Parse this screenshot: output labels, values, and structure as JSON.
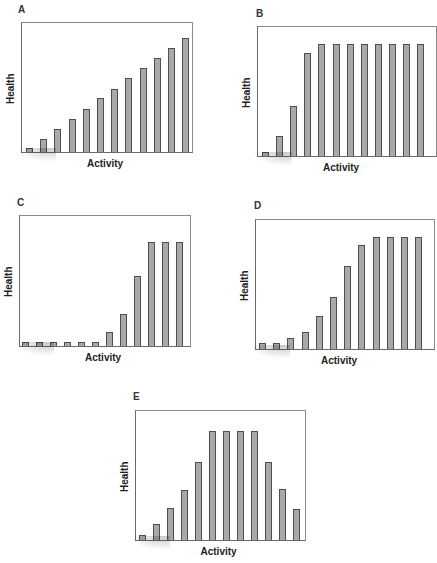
{
  "chart_data": [
    {
      "panel": "A",
      "type": "bar",
      "xlabel": "Activity",
      "ylabel": "Health",
      "categories": [
        1,
        2,
        3,
        4,
        5,
        6,
        7,
        8,
        9,
        10,
        11,
        12
      ],
      "values": [
        3,
        11,
        20,
        28,
        37,
        46,
        54,
        63,
        72,
        80,
        89,
        97
      ],
      "ylim": [
        0,
        110
      ],
      "grid": false,
      "axis_ticks": false
    },
    {
      "panel": "B",
      "type": "bar",
      "xlabel": "Activity",
      "ylabel": "Health",
      "categories": [
        1,
        2,
        3,
        4,
        5,
        6,
        7,
        8,
        9,
        10,
        11,
        12
      ],
      "values": [
        4,
        18,
        45,
        92,
        100,
        100,
        100,
        100,
        100,
        100,
        100,
        100
      ],
      "ylim": [
        0,
        115
      ],
      "grid": false,
      "axis_ticks": false
    },
    {
      "panel": "C",
      "type": "bar",
      "xlabel": "Activity",
      "ylabel": "Health",
      "categories": [
        1,
        2,
        3,
        4,
        5,
        6,
        7,
        8,
        9,
        10,
        11,
        12
      ],
      "values": [
        4,
        4,
        4,
        4,
        4,
        4,
        13,
        31,
        67,
        100,
        100,
        100
      ],
      "ylim": [
        0,
        125
      ],
      "grid": false,
      "axis_ticks": false
    },
    {
      "panel": "D",
      "type": "bar",
      "xlabel": "Activity",
      "ylabel": "Health",
      "categories": [
        1,
        2,
        3,
        4,
        5,
        6,
        7,
        8,
        9,
        10,
        11,
        12
      ],
      "values": [
        5,
        5,
        10,
        15,
        29,
        46,
        74,
        93,
        100,
        100,
        100,
        100
      ],
      "ylim": [
        0,
        115
      ],
      "grid": false,
      "axis_ticks": false
    },
    {
      "panel": "E",
      "type": "bar",
      "xlabel": "Activity",
      "ylabel": "Health",
      "categories": [
        1,
        2,
        3,
        4,
        5,
        6,
        7,
        8,
        9,
        10,
        11,
        12
      ],
      "values": [
        5,
        15,
        29,
        46,
        71,
        100,
        100,
        100,
        100,
        71,
        47,
        28
      ],
      "ylim": [
        0,
        118
      ],
      "grid": false,
      "axis_ticks": false
    }
  ],
  "colors": {
    "bar_fill": "#a9a9a9",
    "bar_edge": "#4e4e4e",
    "frame": "#6a6a6a"
  },
  "layout": [
    {
      "label_x": 18,
      "label_y": 4,
      "frame": [
        21,
        22,
        172,
        131
      ],
      "bars_start": 4,
      "pitch": 14.2
    },
    {
      "label_x": 256,
      "label_y": 8,
      "frame": [
        257,
        26,
        180,
        131
      ],
      "bars_start": 4,
      "pitch": 14.1
    },
    {
      "label_x": 17,
      "label_y": 197,
      "frame": [
        19,
        215,
        172,
        132
      ],
      "bars_start": 2,
      "pitch": 14.0
    },
    {
      "label_x": 254,
      "label_y": 200,
      "frame": [
        255,
        219,
        180,
        131
      ],
      "bars_start": 3,
      "pitch": 14.2
    },
    {
      "label_x": 133,
      "label_y": 391,
      "frame": [
        135,
        410,
        171,
        131
      ],
      "bars_start": 3,
      "pitch": 14.0
    }
  ]
}
